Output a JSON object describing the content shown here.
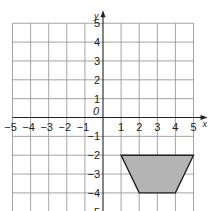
{
  "diagram": {
    "type": "coordinate-grid",
    "x_axis": {
      "label": "x",
      "min": -5,
      "max": 5,
      "ticks": [
        "-5",
        "-4",
        "-3",
        "-2",
        "-1",
        "1",
        "2",
        "3",
        "4",
        "5"
      ]
    },
    "y_axis": {
      "label": "y",
      "min": -5,
      "max": 5,
      "ticks": [
        "5",
        "4",
        "3",
        "2",
        "1",
        "-1",
        "-2",
        "-3",
        "-4",
        "-5"
      ]
    },
    "origin_label": "0",
    "shape": {
      "name": "trapezium",
      "vertices": [
        [
          1,
          -2
        ],
        [
          5,
          -2
        ],
        [
          4,
          -4
        ],
        [
          2,
          -4
        ]
      ],
      "fill": "#b4b4b4",
      "stroke": "#222222"
    },
    "colors": {
      "grid": "#9a9a9a",
      "axis": "#222222",
      "background": "#ffffff"
    }
  }
}
